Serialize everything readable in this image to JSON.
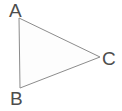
{
  "figure": {
    "kind": "geometry-diagram",
    "shape": "triangle",
    "background_color": "#ffffff",
    "stroke_color": "#8c8c8c",
    "fill_color": "#fdfdfd",
    "stroke_width": 1,
    "label_color": "#4d4d4d",
    "vertices": [
      {
        "id": "a",
        "label": "A",
        "x": 19,
        "y": 18,
        "label_x": 9,
        "label_y": 1
      },
      {
        "id": "b",
        "label": "B",
        "x": 20,
        "y": 88,
        "label_x": 10,
        "label_y": 89
      },
      {
        "id": "c",
        "label": "C",
        "x": 100,
        "y": 57,
        "label_x": 102,
        "label_y": 49
      }
    ],
    "edges": [
      {
        "id": "ab",
        "from": "A",
        "to": "B"
      },
      {
        "id": "bc",
        "from": "B",
        "to": "C"
      },
      {
        "id": "ca",
        "from": "C",
        "to": "A"
      }
    ],
    "polygon_points": "19,18 100,57 20,88"
  }
}
